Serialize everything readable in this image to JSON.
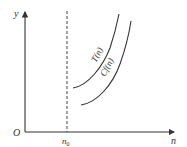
{
  "diagram": {
    "axes": {
      "origin_label": "O",
      "x_label": "n",
      "y_label": "y",
      "threshold_label": "n",
      "threshold_subscript": "0"
    },
    "curves": [
      {
        "name": "T(n)",
        "label": "T(n)"
      },
      {
        "name": "Cf(n)",
        "label": "Cf(n)"
      }
    ],
    "colors": {
      "ink": "#333333",
      "background": "#ffffff"
    }
  }
}
